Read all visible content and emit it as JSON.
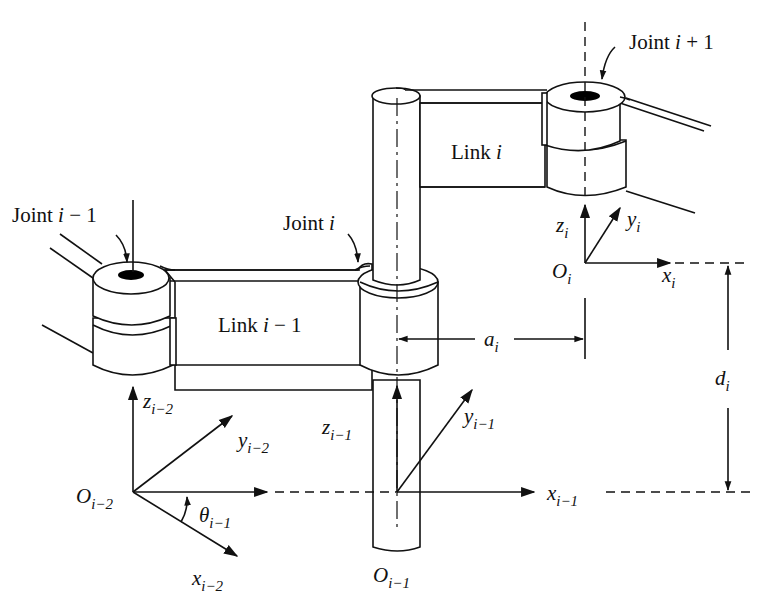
{
  "diagram": {
    "joints": [
      {
        "id": "joint-i-minus-1",
        "label": "Joint",
        "var": "i",
        "suffix": " − 1"
      },
      {
        "id": "joint-i",
        "label": "Joint",
        "var": "i",
        "suffix": ""
      },
      {
        "id": "joint-i-plus-1",
        "label": "Joint",
        "var": "i",
        "suffix": " + 1"
      }
    ],
    "links": [
      {
        "id": "link-i-minus-1",
        "label": "Link",
        "var": "i",
        "suffix": " − 1"
      },
      {
        "id": "link-i",
        "label": "Link",
        "var": "i",
        "suffix": ""
      }
    ],
    "frames": [
      {
        "origin": "O",
        "sub": "i−2",
        "x": "x",
        "y": "y",
        "z": "z",
        "axis_sub": "i−2"
      },
      {
        "origin": "O",
        "sub": "i−1",
        "x": "x",
        "y": "y",
        "z": "z",
        "axis_sub": "i−1"
      },
      {
        "origin": "O",
        "sub": "i",
        "x": "x",
        "y": "y",
        "z": "z",
        "axis_sub": "i"
      }
    ],
    "parameters": {
      "a": {
        "sym": "a",
        "sub": "i"
      },
      "d": {
        "sym": "d",
        "sub": "i"
      },
      "theta": {
        "sym": "θ",
        "sub": "i−1"
      }
    },
    "colors": {
      "ink": "#111111",
      "background": "#ffffff",
      "hole": "#000000"
    }
  }
}
